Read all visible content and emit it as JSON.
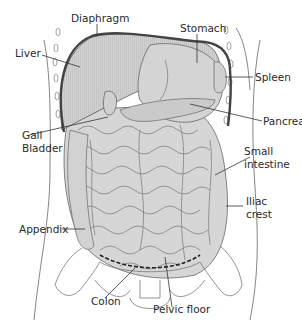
{
  "diagram": {
    "colors": {
      "organ_fill": "#cfcfcf",
      "liver_fill": "#c8c8c8",
      "outline": "#555555",
      "diaphragm": "#444444",
      "leader": "#333333",
      "text": "#2a2a2a"
    },
    "labels": [
      {
        "id": "diaphragm",
        "text": "Diaphragm"
      },
      {
        "id": "stomach",
        "text": "Stomach"
      },
      {
        "id": "liver",
        "text": "Liver"
      },
      {
        "id": "spleen",
        "text": "Spleen"
      },
      {
        "id": "pancreas",
        "text": "Pancreas"
      },
      {
        "id": "gall-bladder",
        "text": "Gall",
        "text2": "Bladder"
      },
      {
        "id": "small-intestine",
        "text": "Small",
        "text2": "intestine"
      },
      {
        "id": "iliac-crest",
        "text": "Iliac",
        "text2": "crest"
      },
      {
        "id": "appendix",
        "text": "Appendix"
      },
      {
        "id": "colon",
        "text": "Colon"
      },
      {
        "id": "pelvic-floor",
        "text": "Pelvic floor"
      }
    ]
  }
}
